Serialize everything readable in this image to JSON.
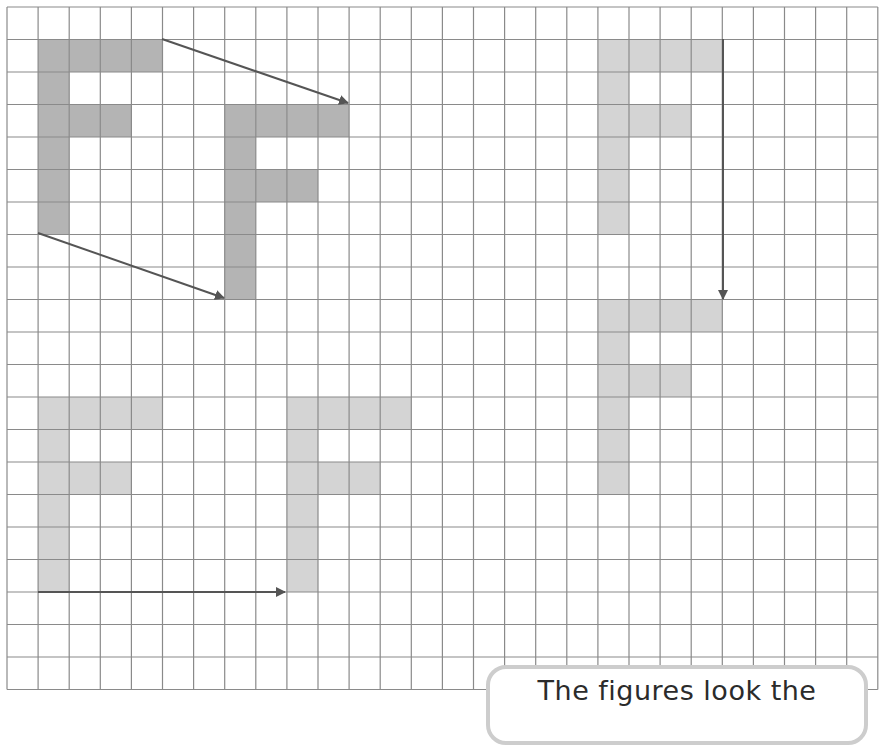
{
  "grid": {
    "origin_x": 7,
    "origin_y": 7,
    "cell_width": 31.1,
    "cell_height": 32.5,
    "columns": 28,
    "rows": 21,
    "line_color": "#8a8a8a",
    "background": "#ffffff"
  },
  "colors": {
    "dark_fill": "#b4b4b4",
    "light_fill": "#d4d4d4",
    "arrow": "#555555",
    "callout_border": "#cdcdcd",
    "text": "#2b2b2b"
  },
  "figures": [
    {
      "id": "F-original-1",
      "shade": "dark",
      "col": 1,
      "row": 1,
      "scale_y": 1
    },
    {
      "id": "F-translated-1",
      "shade": "dark",
      "col": 7,
      "row": 3,
      "scale_y": 1
    },
    {
      "id": "F-original-2",
      "shade": "light",
      "col": 19,
      "row": 1,
      "scale_y": 1
    },
    {
      "id": "F-translated-2",
      "shade": "light",
      "col": 19,
      "row": 9,
      "scale_y": 1
    },
    {
      "id": "F-original-3",
      "shade": "light",
      "col": 1,
      "row": 12,
      "scale_y": 1
    },
    {
      "id": "F-translated-3",
      "shade": "light",
      "col": 9,
      "row": 12,
      "scale_y": 1
    }
  ],
  "f_shape_cells": [
    [
      0,
      0
    ],
    [
      1,
      0
    ],
    [
      2,
      0
    ],
    [
      3,
      0
    ],
    [
      0,
      1
    ],
    [
      0,
      2
    ],
    [
      1,
      2
    ],
    [
      2,
      2
    ],
    [
      0,
      3
    ],
    [
      0,
      4
    ],
    [
      0,
      5
    ]
  ],
  "arrows": [
    {
      "id": "arrow-translate-1-top",
      "x1": 162,
      "y1": 39,
      "x2": 348,
      "y2": 103
    },
    {
      "id": "arrow-translate-1-bottom",
      "x1": 38,
      "y1": 233,
      "x2": 224,
      "y2": 298
    },
    {
      "id": "arrow-translate-2-down",
      "x1": 723,
      "y1": 39,
      "x2": 723,
      "y2": 299
    },
    {
      "id": "arrow-translate-3-right",
      "x1": 38,
      "y1": 592,
      "x2": 285,
      "y2": 592
    }
  ],
  "callout": {
    "text": "The figures look the"
  }
}
